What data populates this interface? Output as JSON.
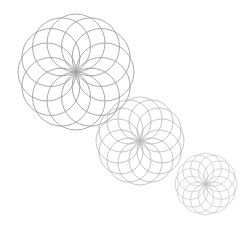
{
  "canvas": {
    "width": 242,
    "height": 233,
    "background": "#ffffff"
  },
  "rosettes": [
    {
      "name": "large",
      "cx": 76,
      "cy": 72,
      "radius": 58,
      "circles": 12,
      "stroke": "#9a9a9a",
      "stroke_width": 0.9,
      "opacity": 0.95
    },
    {
      "name": "medium",
      "cx": 140,
      "cy": 141,
      "radius": 44,
      "circles": 12,
      "stroke": "#a8a8a8",
      "stroke_width": 0.8,
      "opacity": 0.85
    },
    {
      "name": "small",
      "cx": 206,
      "cy": 184,
      "radius": 31,
      "circles": 12,
      "stroke": "#b4b4b4",
      "stroke_width": 0.7,
      "opacity": 0.8
    }
  ]
}
